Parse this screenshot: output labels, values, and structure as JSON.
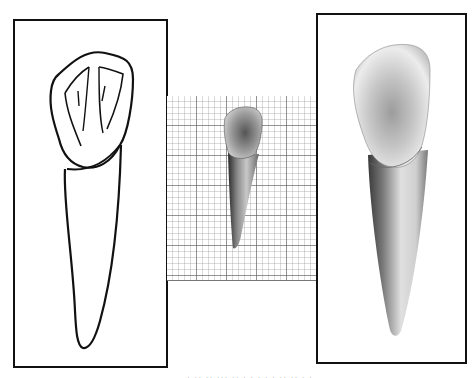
{
  "figure": {
    "panels": [
      {
        "id": "left",
        "label": "Outline drawing of tooth (labial view)",
        "style": "line-drawing"
      },
      {
        "id": "middle",
        "label": "Photograph of tooth on millimeter grid",
        "style": "photo-on-grid"
      },
      {
        "id": "right",
        "label": "Shaded rendering of tooth (labial view)",
        "style": "shaded-illustration"
      }
    ],
    "caption": "· ·· ·· ···  ·· · · · · ·  ·· ·· · ·"
  },
  "colors": {
    "border": "#111111",
    "grid_major": "#5a5a5a",
    "grid_minor": "#969696",
    "background": "#ffffff"
  }
}
